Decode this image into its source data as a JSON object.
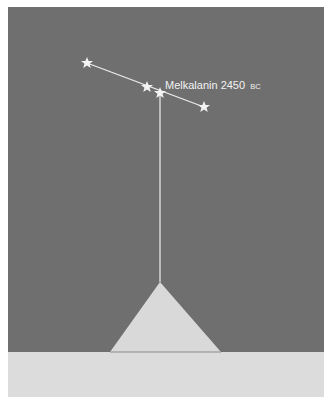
{
  "diagram": {
    "label": {
      "name": "Melkalanin 2450",
      "era": "BC"
    },
    "colors": {
      "sky": "#6f6f6f",
      "ground": "#dcdcdc",
      "pyramid": "#d9d9d9",
      "line": "#eeeeee",
      "star": "#f4f4f4",
      "page": "#ffffff"
    },
    "stars": [
      {
        "x": 87,
        "y": 63
      },
      {
        "x": 147,
        "y": 87
      },
      {
        "x": 160,
        "y": 93
      },
      {
        "x": 204,
        "y": 107
      }
    ],
    "pyramid": {
      "apex": {
        "x": 160,
        "y": 282
      },
      "base_left": {
        "x": 110,
        "y": 352
      },
      "base_right": {
        "x": 221,
        "y": 352
      }
    }
  }
}
